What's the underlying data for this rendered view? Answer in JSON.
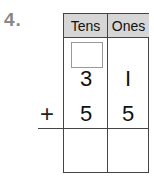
{
  "problem": {
    "number": "4.",
    "columns": [
      "Tens",
      "Ones"
    ],
    "regroup_box": "",
    "addend1": {
      "tens": "3",
      "ones": "I"
    },
    "operator": "+",
    "addend2": {
      "tens": "5",
      "ones": "5"
    },
    "answer": {
      "tens": "",
      "ones": ""
    }
  }
}
